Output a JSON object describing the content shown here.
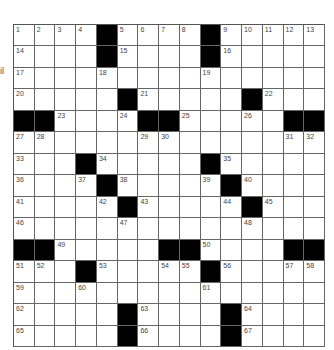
{
  "side_fragment": "il",
  "colors": {
    "block": "#000000",
    "cell": "#ffffff",
    "line": "#666666",
    "number": "#444444"
  },
  "grid": {
    "rows": 15,
    "cols": 15,
    "cells": [
      [
        "1",
        "2",
        "3",
        "4",
        "#",
        "5",
        "6",
        "7",
        "8",
        "#",
        "9",
        "10",
        "11",
        "12",
        "13"
      ],
      [
        "14",
        "",
        "",
        "",
        "#",
        "15",
        "",
        "",
        "",
        "#",
        "16",
        "",
        "",
        "",
        ""
      ],
      [
        "17",
        "",
        "",
        "",
        "18",
        "",
        "",
        "",
        "",
        "19",
        "",
        "",
        "",
        "",
        ""
      ],
      [
        "20",
        "",
        "",
        "",
        "",
        "#",
        "21",
        "",
        "",
        "",
        "",
        "#",
        "22",
        "",
        ""
      ],
      [
        "#",
        "#",
        "23",
        "",
        "",
        "24",
        "#",
        "#",
        "25",
        "",
        "",
        "26",
        "",
        "#",
        "#"
      ],
      [
        "27",
        "28",
        "",
        "",
        "",
        "",
        "29",
        "30",
        "",
        "",
        "",
        "",
        "",
        "31",
        "32"
      ],
      [
        "33",
        "",
        "",
        "#",
        "34",
        "",
        "",
        "",
        "",
        "#",
        "35",
        "",
        "",
        "",
        ""
      ],
      [
        "36",
        "",
        "",
        "37",
        "#",
        "38",
        "",
        "",
        "",
        "39",
        "#",
        "40",
        "",
        "",
        ""
      ],
      [
        "41",
        "",
        "",
        "",
        "42",
        "#",
        "43",
        "",
        "",
        "",
        "44",
        "#",
        "45",
        "",
        ""
      ],
      [
        "46",
        "",
        "",
        "",
        "",
        "47",
        "",
        "",
        "",
        "",
        "",
        "48",
        "",
        "",
        ""
      ],
      [
        "#",
        "#",
        "49",
        "",
        "",
        "",
        "",
        "#",
        "#",
        "50",
        "",
        "",
        "",
        "#",
        "#"
      ],
      [
        "51",
        "52",
        "",
        "#",
        "53",
        "",
        "",
        "54",
        "55",
        "#",
        "56",
        "",
        "",
        "57",
        "58"
      ],
      [
        "59",
        "",
        "",
        "60",
        "",
        "",
        "",
        "",
        "",
        "61",
        "",
        "",
        "",
        "",
        ""
      ],
      [
        "62",
        "",
        "",
        "",
        "",
        "#",
        "63",
        "",
        "",
        "",
        "#",
        "64",
        "",
        "",
        ""
      ],
      [
        "65",
        "",
        "",
        "",
        "",
        "#",
        "66",
        "",
        "",
        "",
        "#",
        "67",
        "",
        "",
        ""
      ]
    ]
  }
}
